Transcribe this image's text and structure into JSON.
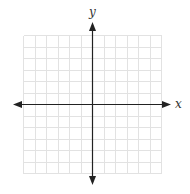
{
  "diagram": {
    "type": "coordinate-plane",
    "x_axis_label": "x",
    "y_axis_label": "y",
    "grid": {
      "columns": 12,
      "rows": 12,
      "x_range": [
        -6,
        6
      ],
      "y_range": [
        -6,
        6
      ],
      "tick_labels_shown": false
    },
    "colors": {
      "grid_line": "#e2e2e2",
      "axis": "#222222",
      "label": "#333333",
      "background": "#ffffff"
    }
  }
}
